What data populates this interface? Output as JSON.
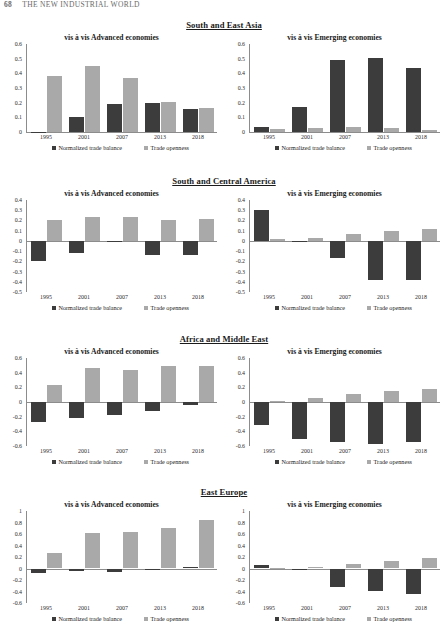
{
  "running_head": {
    "page_number": "68",
    "title": "THE NEW INDUSTRIAL WORLD"
  },
  "legend": {
    "series_dark_label": "Normalized trade balance",
    "series_light_label": "Trade openness",
    "dark_color": "#3c3c3c",
    "light_color": "#a9a9a9"
  },
  "panel_titles": {
    "advanced": "vis à vis Advanced economies",
    "emerging": "vis à vis Emerging economies"
  },
  "regions": [
    {
      "title": "South and East Asia"
    },
    {
      "title": "South and Central America"
    },
    {
      "title": "Africa and Middle East"
    },
    {
      "title": "East Europe"
    }
  ],
  "chart_data": [
    {
      "type": "bar",
      "title": "South and East Asia",
      "subtitle": "vis à vis Advanced economies",
      "xlabel": "",
      "ylabel": "",
      "categories": [
        "1995",
        "2001",
        "2007",
        "2013",
        "2018"
      ],
      "ylim": [
        0,
        0.6
      ],
      "yticks": [
        0,
        0.1,
        0.2,
        0.3,
        0.4,
        0.5,
        0.6
      ],
      "ytick_labels": [
        "0",
        "0.1",
        "0.2",
        "0.3",
        "0.4",
        "0.5",
        "0.6"
      ],
      "grid": false,
      "legend_position": "bottom",
      "series": [
        {
          "name": "Normalized trade balance",
          "values": [
            0.003,
            0.105,
            0.193,
            0.199,
            0.158
          ]
        },
        {
          "name": "Trade openness",
          "values": [
            0.385,
            0.451,
            0.365,
            0.203,
            0.167
          ]
        }
      ]
    },
    {
      "type": "bar",
      "title": "South and East Asia",
      "subtitle": "vis à vis Emerging economies",
      "xlabel": "",
      "ylabel": "",
      "categories": [
        "1995",
        "2001",
        "2007",
        "2013",
        "2018"
      ],
      "ylim": [
        0,
        0.6
      ],
      "yticks": [
        0,
        0.1,
        0.2,
        0.3,
        0.4,
        0.5,
        0.6
      ],
      "ytick_labels": [
        "0",
        "0.1",
        "0.2",
        "0.3",
        "0.4",
        "0.5",
        "0.6"
      ],
      "grid": false,
      "legend_position": "bottom",
      "series": [
        {
          "name": "Normalized trade balance",
          "values": [
            0.037,
            0.168,
            0.488,
            0.503,
            0.433
          ]
        },
        {
          "name": "Trade openness",
          "values": [
            0.019,
            0.026,
            0.035,
            0.025,
            0.016
          ]
        }
      ]
    },
    {
      "type": "bar",
      "title": "South and Central America",
      "subtitle": "vis à vis Advanced economies",
      "xlabel": "",
      "ylabel": "",
      "categories": [
        "1995",
        "2001",
        "2007",
        "2013",
        "2018"
      ],
      "ylim": [
        -0.5,
        0.4
      ],
      "yticks": [
        -0.5,
        -0.4,
        -0.3,
        -0.2,
        -0.1,
        0,
        0.1,
        0.2,
        0.3,
        0.4
      ],
      "ytick_labels": [
        "-0.5",
        "-0.4",
        "-0.3",
        "-0.2",
        "-0.1",
        "0",
        "0.1",
        "0.2",
        "0.3",
        "0.4"
      ],
      "grid": false,
      "legend_position": "bottom",
      "series": [
        {
          "name": "Normalized trade balance",
          "values": [
            -0.198,
            -0.118,
            -0.004,
            -0.143,
            -0.142
          ]
        },
        {
          "name": "Trade openness",
          "values": [
            0.206,
            0.237,
            0.231,
            0.201,
            0.212
          ]
        }
      ]
    },
    {
      "type": "bar",
      "title": "South and Central America",
      "subtitle": "vis à vis Emerging economies",
      "xlabel": "",
      "ylabel": "",
      "categories": [
        "1995",
        "2001",
        "2007",
        "2013",
        "2018"
      ],
      "ylim": [
        -0.5,
        0.4
      ],
      "yticks": [
        -0.5,
        -0.4,
        -0.3,
        -0.2,
        -0.1,
        0,
        0.1,
        0.2,
        0.3,
        0.4
      ],
      "ytick_labels": [
        "-0.5",
        "-0.4",
        "-0.3",
        "-0.2",
        "-0.1",
        "0",
        "0.1",
        "0.2",
        "0.3",
        "0.4"
      ],
      "grid": false,
      "legend_position": "bottom",
      "series": [
        {
          "name": "Normalized trade balance",
          "values": [
            0.298,
            -0.006,
            -0.166,
            -0.383,
            -0.378
          ]
        },
        {
          "name": "Trade openness",
          "values": [
            0.018,
            0.029,
            0.063,
            0.094,
            0.118
          ]
        }
      ]
    },
    {
      "type": "bar",
      "title": "Africa and Middle East",
      "subtitle": "vis à vis Advanced economies",
      "xlabel": "",
      "ylabel": "",
      "categories": [
        "1995",
        "2001",
        "2007",
        "2013",
        "2018"
      ],
      "ylim": [
        -0.6,
        0.6
      ],
      "yticks": [
        -0.6,
        -0.4,
        -0.2,
        0,
        0.2,
        0.4,
        0.6
      ],
      "ytick_labels": [
        "-0.6",
        "-0.4",
        "-0.2",
        "0",
        "0.2",
        "0.4",
        "0.6"
      ],
      "grid": false,
      "legend_position": "bottom",
      "series": [
        {
          "name": "Normalized trade balance",
          "values": [
            -0.277,
            -0.212,
            -0.182,
            -0.123,
            -0.045
          ]
        },
        {
          "name": "Trade openness",
          "values": [
            0.236,
            0.458,
            0.443,
            0.497,
            0.487
          ]
        }
      ]
    },
    {
      "type": "bar",
      "title": "Africa and Middle East",
      "subtitle": "vis à vis Emerging economies",
      "xlabel": "",
      "ylabel": "",
      "categories": [
        "1995",
        "2001",
        "2007",
        "2013",
        "2018"
      ],
      "ylim": [
        -0.6,
        0.6
      ],
      "yticks": [
        -0.6,
        -0.4,
        -0.2,
        0,
        0.2,
        0.4,
        0.6
      ],
      "ytick_labels": [
        "-0.6",
        "-0.4",
        "-0.2",
        "0",
        "0.2",
        "0.4",
        "0.6"
      ],
      "grid": false,
      "legend_position": "bottom",
      "series": [
        {
          "name": "Normalized trade balance",
          "values": [
            -0.318,
            -0.498,
            -0.548,
            -0.578,
            -0.548
          ]
        },
        {
          "name": "Trade openness",
          "values": [
            0.016,
            0.048,
            0.106,
            0.152,
            0.175
          ]
        }
      ]
    },
    {
      "type": "bar",
      "title": "East Europe",
      "subtitle": "vis à vis Advanced economies",
      "xlabel": "",
      "ylabel": "",
      "categories": [
        "1995",
        "2001",
        "2007",
        "2013",
        "2018"
      ],
      "ylim": [
        -0.6,
        1.0
      ],
      "yticks": [
        -0.6,
        -0.4,
        -0.2,
        0,
        0.2,
        0.4,
        0.6,
        0.8,
        1
      ],
      "ytick_labels": [
        "-0.6",
        "-0.4",
        "-0.2",
        "0",
        "0.2",
        "0.4",
        "0.6",
        "0.8",
        "1"
      ],
      "grid": false,
      "legend_position": "bottom",
      "series": [
        {
          "name": "Normalized trade balance",
          "values": [
            -0.072,
            -0.045,
            -0.061,
            -0.029,
            0.028
          ]
        },
        {
          "name": "Trade openness",
          "values": [
            0.277,
            0.611,
            0.629,
            0.702,
            0.845
          ]
        }
      ]
    },
    {
      "type": "bar",
      "title": "East Europe",
      "subtitle": "vis à vis Emerging economies",
      "xlabel": "",
      "ylabel": "",
      "categories": [
        "1995",
        "2001",
        "2007",
        "2013",
        "2018"
      ],
      "ylim": [
        -0.6,
        1.0
      ],
      "yticks": [
        -0.6,
        -0.4,
        -0.2,
        0,
        0.2,
        0.4,
        0.6,
        0.8,
        1
      ],
      "ytick_labels": [
        "-0.6",
        "-0.4",
        "-0.2",
        "0",
        "0.2",
        "0.4",
        "0.6",
        "0.8",
        "1"
      ],
      "grid": false,
      "legend_position": "bottom",
      "series": [
        {
          "name": "Normalized trade balance",
          "values": [
            0.068,
            -0.032,
            -0.325,
            -0.395,
            -0.447
          ]
        },
        {
          "name": "Trade openness",
          "values": [
            0.004,
            0.022,
            0.078,
            0.133,
            0.178
          ]
        }
      ]
    }
  ]
}
